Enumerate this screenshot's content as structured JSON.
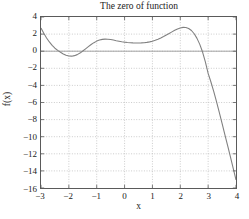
{
  "chart_data": {
    "type": "line",
    "title": "The zero of function",
    "xlabel": "x",
    "ylabel": "f(x)",
    "xlim": [
      -3,
      4
    ],
    "ylim": [
      -16,
      4
    ],
    "grid": true,
    "legend": null,
    "xticks": [
      -3,
      -2,
      -1,
      0,
      1,
      2,
      3,
      4
    ],
    "xtick_labels": [
      "-3",
      "-2",
      "-1",
      "0",
      "1",
      "2",
      "3",
      "4"
    ],
    "yticks": [
      4,
      2,
      0,
      -2,
      -4,
      -6,
      -8,
      -10,
      -12,
      -14,
      -16
    ],
    "ytick_labels": [
      "4",
      "2",
      "0",
      "-2",
      "-4",
      "-6",
      "-8",
      "-10",
      "-12",
      "-14",
      "-16"
    ],
    "line_color": "#808080",
    "grid_color": "#b5b5b5",
    "axis_color": "#5a5a5a",
    "series": [
      {
        "name": "f(x)",
        "x": [
          -3.0,
          -2.9,
          -2.8,
          -2.7,
          -2.6,
          -2.5,
          -2.4,
          -2.3,
          -2.2,
          -2.1,
          -2.0,
          -1.9,
          -1.8,
          -1.7,
          -1.6,
          -1.5,
          -1.4,
          -1.3,
          -1.2,
          -1.1,
          -1.0,
          -0.9,
          -0.8,
          -0.7,
          -0.6,
          -0.5,
          -0.4,
          -0.3,
          -0.2,
          -0.1,
          0.0,
          0.1,
          0.2,
          0.3,
          0.4,
          0.5,
          0.6,
          0.7,
          0.8,
          0.9,
          1.0,
          1.1,
          1.2,
          1.3,
          1.4,
          1.5,
          1.6,
          1.7,
          1.8,
          1.9,
          2.0,
          2.1,
          2.2,
          2.3,
          2.4,
          2.5,
          2.6,
          2.7,
          2.8,
          2.9,
          3.0,
          3.1,
          3.2,
          3.3,
          3.4,
          3.5,
          3.6,
          3.7,
          3.8,
          3.9,
          4.0
        ],
        "y": [
          2.7,
          2.1,
          1.55,
          1.08,
          0.68,
          0.35,
          0.1,
          -0.12,
          -0.32,
          -0.48,
          -0.57,
          -0.58,
          -0.52,
          -0.4,
          -0.22,
          0.02,
          0.28,
          0.54,
          0.79,
          1.0,
          1.18,
          1.3,
          1.38,
          1.41,
          1.4,
          1.36,
          1.3,
          1.23,
          1.17,
          1.11,
          1.06,
          1.02,
          0.99,
          0.97,
          0.96,
          0.96,
          0.97,
          0.99,
          1.03,
          1.09,
          1.17,
          1.27,
          1.4,
          1.55,
          1.72,
          1.9,
          2.08,
          2.26,
          2.44,
          2.6,
          2.72,
          2.79,
          2.78,
          2.66,
          2.42,
          2.04,
          1.5,
          0.8,
          -0.1,
          -1.25,
          -2.6,
          -3.6,
          -4.7,
          -5.9,
          -7.15,
          -8.45,
          -9.75,
          -11.05,
          -12.35,
          -13.7,
          -15.05
        ],
        "zero_crossings": [
          -2.42,
          -1.52,
          2.78
        ]
      }
    ]
  }
}
